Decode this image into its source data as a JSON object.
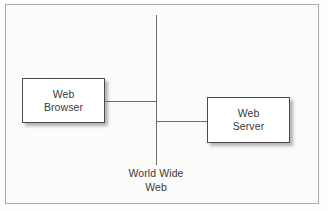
{
  "diagram": {
    "background_color": "#fbfbfa",
    "line_color": "#6e6e6e",
    "box_border_color": "#4a4a4a",
    "text_color": "#3a3a3a",
    "frame": {
      "border_color": "#a9a9a9"
    },
    "nodes": [
      {
        "id": "web-browser",
        "line1": "Web",
        "line2": "Browser"
      },
      {
        "id": "web-server",
        "line1": "Web",
        "line2": "Server"
      }
    ],
    "spine": {
      "caption_line1": "World Wide",
      "caption_line2": "Web"
    }
  }
}
